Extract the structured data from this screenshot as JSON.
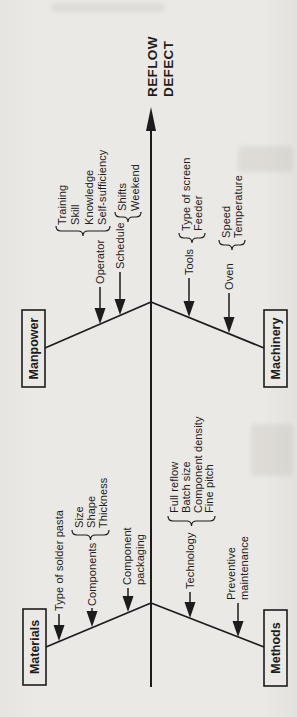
{
  "title": {
    "line1": "REFLOW",
    "line2": "DEFECT"
  },
  "categories": [
    {
      "name": "Manpower",
      "branches": [
        {
          "label": "Operator",
          "items": [
            "Training",
            "Skill",
            "Knowledge",
            "Self-sufficiency"
          ]
        },
        {
          "label": "Schedule",
          "items": [
            "Shifts",
            "Weekend"
          ]
        }
      ]
    },
    {
      "name": "Machinery",
      "branches": [
        {
          "label": "Tools",
          "items": [
            "Type of screen",
            "Feeder"
          ]
        },
        {
          "label": "Oven",
          "items": [
            "Speed",
            "Temperature"
          ]
        }
      ]
    },
    {
      "name": "Materials",
      "branches": [
        {
          "label": "Type of solder pasta",
          "items": []
        },
        {
          "label": "Components",
          "items": [
            "Size",
            "Shape",
            "Thickness"
          ]
        },
        {
          "label_lines": [
            "Component",
            "packaging"
          ],
          "items": []
        }
      ]
    },
    {
      "name": "Methods",
      "branches": [
        {
          "label": "Technology",
          "items": [
            "Full reflow",
            "Batch size",
            "Component density",
            "Fine pitch"
          ]
        },
        {
          "label_lines": [
            "Preventive",
            "maintenance"
          ],
          "items": []
        }
      ]
    }
  ],
  "colors": {
    "ink": "#1c1c1c",
    "paper": "#ebe9e5"
  }
}
